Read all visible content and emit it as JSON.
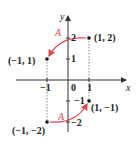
{
  "axes": {
    "x_label": "x",
    "y_label": "y",
    "origin_label": "0"
  },
  "ticks": {
    "x": [
      "−1",
      "1"
    ],
    "y": [
      "2",
      "1",
      "−1",
      "−2"
    ]
  },
  "points": [
    {
      "label": "(1,  2)",
      "x": 1,
      "y": 2
    },
    {
      "label": "(−1,  1)",
      "x": -1,
      "y": 1
    },
    {
      "label": "(1,  −1)",
      "x": 1,
      "y": -1
    },
    {
      "label": "(−1,  −2)",
      "x": -1,
      "y": -2
    }
  ],
  "transform_labels": {
    "top": "A",
    "bottom": "A"
  },
  "colors": {
    "arrow": "#e0464e",
    "axis": "#333333",
    "dotted": "#666666"
  }
}
